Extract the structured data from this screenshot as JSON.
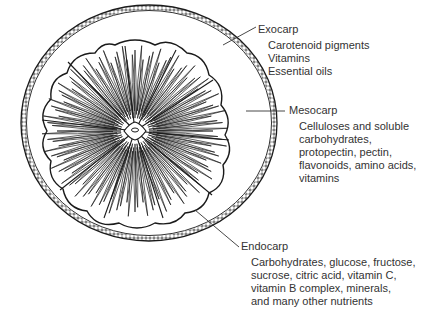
{
  "diagram": {
    "labels": [
      {
        "id": "exocarp",
        "title": "Exocarp",
        "items": [
          "Carotenoid pigments",
          "Vitamins",
          "Essential oils"
        ]
      },
      {
        "id": "mesocarp",
        "title": "Mesocarp",
        "items": [
          "Celluloses and soluble",
          "carbohydrates,",
          "protopectin, pectin,",
          "flavonoids, amino acids,",
          "vitamins"
        ]
      },
      {
        "id": "endocarp",
        "title": "Endocarp",
        "items": [
          "Carbohydrates, glucose, fructose,",
          "sucrose, citric acid, vitamin C,",
          "vitamin B complex, minerals,",
          "and many other nutrients"
        ]
      }
    ],
    "colors": {
      "ink": "#1a1a1a",
      "text": "#333333",
      "background": "#ffffff"
    }
  }
}
